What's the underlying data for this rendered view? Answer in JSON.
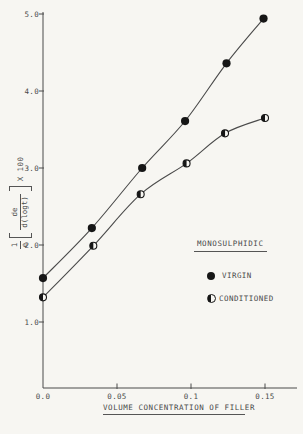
{
  "figure": {
    "background": "#f7f6f2",
    "ink": "#4a4a4a",
    "marker_color": "#161616"
  },
  "chart_data": {
    "type": "line",
    "title": "",
    "xlabel": "VOLUME CONCENTRATION OF FILLER",
    "ylabel": "1/e [de/d(logt)] X 100",
    "y_formula": {
      "num1": "1",
      "den1": "e",
      "num2": "de",
      "den2": "d(logt)",
      "times": "X 100"
    },
    "legend_title": "MONOSULPHIDIC",
    "legend_position": "middle-right",
    "grid": false,
    "xlim": [
      0,
      0.172
    ],
    "ylim": [
      0.14,
      5.03
    ],
    "xticks": [
      0,
      0.05,
      0.1,
      0.15
    ],
    "xtick_labels": [
      "0.0",
      "0.05",
      "0.1",
      "0.15"
    ],
    "yticks": [
      1,
      2,
      3,
      4,
      5
    ],
    "ytick_labels": [
      "1.0",
      "2.0",
      "3.0",
      "4.0",
      "5.0"
    ],
    "series": [
      {
        "name": "VIRGIN",
        "marker": "filled-circle",
        "x": [
          0,
          0.033,
          0.067,
          0.096,
          0.124,
          0.149
        ],
        "y": [
          1.57,
          2.22,
          3.0,
          3.61,
          4.36,
          4.94
        ]
      },
      {
        "name": "CONDITIONED",
        "marker": "half-filled-circle",
        "x": [
          0,
          0.034,
          0.066,
          0.097,
          0.123,
          0.15
        ],
        "y": [
          1.32,
          1.99,
          2.66,
          3.06,
          3.45,
          3.65
        ]
      }
    ]
  }
}
